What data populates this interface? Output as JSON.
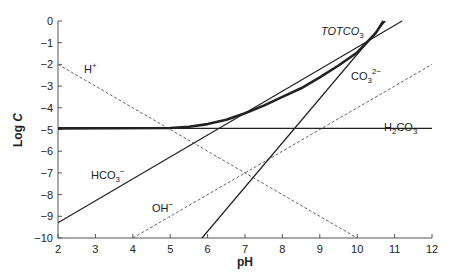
{
  "chart_data": {
    "type": "line",
    "title": "",
    "xlabel": "pH",
    "ylabel": "Log C",
    "xlim": [
      2,
      12
    ],
    "ylim": [
      -10,
      0
    ],
    "x_ticks": [
      2,
      3,
      4,
      5,
      6,
      7,
      8,
      9,
      10,
      11,
      12
    ],
    "y_ticks": [
      0,
      -1,
      -2,
      -3,
      -4,
      -5,
      -6,
      -7,
      -8,
      -9,
      -10
    ],
    "x_tick_labels": [
      "2",
      "3",
      "4",
      "5",
      "6",
      "7",
      "8",
      "9",
      "10",
      "11",
      "12"
    ],
    "y_tick_labels": [
      "0",
      "−1",
      "−2",
      "−3",
      "−4",
      "−5",
      "−6",
      "−7",
      "−8",
      "−9",
      "−10"
    ],
    "grid": false,
    "legend": "inline labels",
    "series": [
      {
        "name": "H+",
        "label": "H",
        "sup": "+",
        "style": "dashed",
        "x": [
          2,
          10
        ],
        "y": [
          -2,
          -10
        ]
      },
      {
        "name": "OH-",
        "label": "OH",
        "sup": "−",
        "style": "dashed",
        "x": [
          4,
          12
        ],
        "y": [
          -10,
          -2
        ]
      },
      {
        "name": "H2CO3",
        "label": "H",
        "sub": "2",
        "label2": "CO",
        "sub2": "3",
        "style": "solid",
        "x": [
          2,
          12
        ],
        "y": [
          -4.95,
          -4.95
        ]
      },
      {
        "name": "HCO3-",
        "label": "HCO",
        "sub": "3",
        "sup": "−",
        "style": "solid",
        "x": [
          2,
          11.2
        ],
        "y": [
          -9.3,
          0
        ]
      },
      {
        "name": "CO3 2-",
        "label": "CO",
        "sub": "3",
        "sup": "2−",
        "style": "solid",
        "x": [
          5.85,
          10.75
        ],
        "y": [
          -10,
          0
        ]
      },
      {
        "name": "TOTCO3",
        "label": "TOTCO",
        "sub": "3",
        "style": "thick",
        "x": [
          2,
          5,
          5.5,
          6,
          6.5,
          7,
          7.5,
          8,
          8.5,
          9,
          9.5,
          10,
          10.5,
          10.7
        ],
        "y": [
          -4.95,
          -4.93,
          -4.87,
          -4.75,
          -4.55,
          -4.25,
          -3.9,
          -3.5,
          -3.1,
          -2.6,
          -2.05,
          -1.45,
          -0.55,
          0
        ]
      }
    ]
  },
  "labels": {
    "xlabel": "pH",
    "ylabel_log": "Log",
    "ylabel_c": "C",
    "h_plus": "H",
    "h_plus_sup": "+",
    "oh_minus": "OH",
    "oh_minus_sup": "−",
    "h2co3_a": "H",
    "h2co3_sub": "2",
    "h2co3_b": "CO",
    "h2co3_sub2": "3",
    "hco3": "HCO",
    "hco3_sub": "3",
    "hco3_sup": "−",
    "co3": "CO",
    "co3_sub": "3",
    "co3_sup": "2−",
    "totco3": "TOTCO",
    "totco3_sub": "3"
  }
}
